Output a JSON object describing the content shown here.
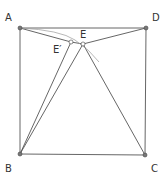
{
  "diagram": {
    "type": "geometry",
    "colors": {
      "line": "#555555",
      "point": "#555555",
      "arc": "#999999",
      "label": "#333333"
    },
    "points": {
      "A": {
        "label": "A",
        "x": 20,
        "y": 28
      },
      "D": {
        "label": "D",
        "x": 146,
        "y": 28
      },
      "B": {
        "label": "B",
        "x": 20,
        "y": 154
      },
      "C": {
        "label": "C",
        "x": 145,
        "y": 155
      },
      "E": {
        "label": "E",
        "x": 83,
        "y": 44
      },
      "E_prime": {
        "label": "E′",
        "x": 71,
        "y": 42
      }
    },
    "segments": [
      [
        "A",
        "D"
      ],
      [
        "D",
        "C"
      ],
      [
        "C",
        "B"
      ],
      [
        "B",
        "A"
      ],
      [
        "A",
        "E_prime"
      ],
      [
        "E_prime",
        "E"
      ],
      [
        "E",
        "D"
      ],
      [
        "B",
        "E_prime"
      ],
      [
        "B",
        "E"
      ],
      [
        "E",
        "C"
      ]
    ],
    "arc": {
      "from": "A",
      "through": "E_prime",
      "to_end": [
        99,
        62
      ]
    }
  }
}
